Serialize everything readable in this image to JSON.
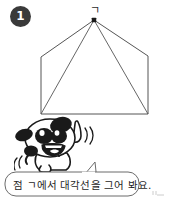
{
  "page": {
    "width": 169,
    "height": 199,
    "background": "#ffffff"
  },
  "step": {
    "number": "1",
    "badge_color": "#3a3a3a",
    "badge_text_color": "#ffffff"
  },
  "figure": {
    "name": "pentagon-with-diagonals",
    "vertex_label": "ㄱ",
    "line_color": "#555555",
    "apex_dot_color": "#1a1a1a",
    "vertices": [
      {
        "label": "ㄱ",
        "x": 94,
        "y": 20
      },
      {
        "label": "",
        "x": 148,
        "y": 56
      },
      {
        "label": "",
        "x": 148,
        "y": 114
      },
      {
        "label": "",
        "x": 41,
        "y": 114
      },
      {
        "label": "",
        "x": 41,
        "y": 57
      }
    ],
    "diagonals": [
      {
        "from": 0,
        "to": 2
      },
      {
        "from": 0,
        "to": 3
      }
    ]
  },
  "character": {
    "name": "dog-mascot",
    "description": "cartoon dog pointing upward with one finger",
    "outline_color": "#1a1a1a",
    "fill_color": "#ffffff",
    "patch_color": "#1a1a1a"
  },
  "speech": {
    "text": "점 ㄱ에서 대각선을 그어 봐요.",
    "border_color": "#6b6b6b",
    "fill_color": "#ffffff",
    "text_color": "#1e1e1e"
  }
}
